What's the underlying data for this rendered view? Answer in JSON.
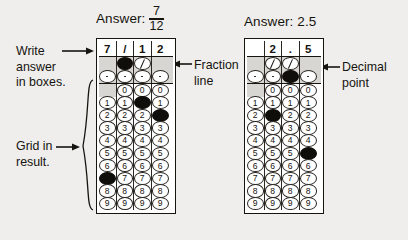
{
  "page": {
    "background": "#efeeec",
    "ink": "#16140f",
    "fill_color": "#100e0b",
    "band_color": "#d8d6d2"
  },
  "annotations": [
    {
      "id": "write-answer",
      "text_lines": [
        "Write",
        "answer",
        "in boxes."
      ],
      "arrow": "right"
    },
    {
      "id": "grid-in-result",
      "text_lines": [
        "Grid in",
        "result."
      ],
      "arrow": "right"
    },
    {
      "id": "fraction-line",
      "text_lines": [
        "Fraction",
        "line"
      ],
      "arrow": "left"
    },
    {
      "id": "decimal-point",
      "text_lines": [
        "Decimal",
        "point"
      ],
      "arrow": "left"
    }
  ],
  "grids": [
    {
      "id": "fraction-grid",
      "answer_label": "Answer:",
      "answer_type": "fraction",
      "answer_numerator": "7",
      "answer_denominator": "12",
      "answer_plain": "7/12",
      "columns": 4,
      "written": [
        "7",
        "/",
        "1",
        "2"
      ],
      "slash_row": {
        "label": "/",
        "cells": [
          "none",
          "filled",
          "open",
          "none"
        ]
      },
      "decimal_row": {
        "label": ".",
        "cells": [
          "open",
          "open",
          "open",
          "open"
        ]
      },
      "digits": [
        "0",
        "1",
        "2",
        "3",
        "4",
        "5",
        "6",
        "7",
        "8",
        "9"
      ],
      "digit_cells": [
        {
          "column": 1,
          "has_zero": false,
          "filled_digit": "7"
        },
        {
          "column": 2,
          "has_zero": true,
          "filled_digit": null
        },
        {
          "column": 3,
          "has_zero": true,
          "filled_digit": "1"
        },
        {
          "column": 4,
          "has_zero": true,
          "filled_digit": "2"
        }
      ]
    },
    {
      "id": "decimal-grid",
      "answer_label": "Answer: 2.5",
      "answer_type": "decimal",
      "answer_plain": "2.5",
      "columns": 4,
      "written": [
        "",
        "2",
        ".",
        "5"
      ],
      "slash_row": {
        "label": "/",
        "cells": [
          "none",
          "open",
          "open",
          "none"
        ]
      },
      "decimal_row": {
        "label": ".",
        "cells": [
          "open",
          "open",
          "filled",
          "open"
        ]
      },
      "digits": [
        "0",
        "1",
        "2",
        "3",
        "4",
        "5",
        "6",
        "7",
        "8",
        "9"
      ],
      "digit_cells": [
        {
          "column": 1,
          "has_zero": false,
          "filled_digit": null
        },
        {
          "column": 2,
          "has_zero": true,
          "filled_digit": "2"
        },
        {
          "column": 3,
          "has_zero": true,
          "filled_digit": null
        },
        {
          "column": 4,
          "has_zero": true,
          "filled_digit": "5"
        }
      ]
    }
  ]
}
